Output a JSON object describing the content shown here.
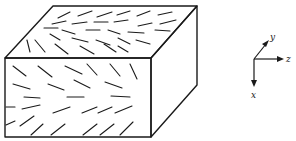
{
  "figure": {
    "box": {
      "front_face": [
        [
          5,
          58
        ],
        [
          151,
          58
        ],
        [
          151,
          137
        ],
        [
          5,
          137
        ]
      ],
      "top_face": [
        [
          5,
          58
        ],
        [
          53,
          6
        ],
        [
          197,
          6
        ],
        [
          151,
          58
        ]
      ],
      "side_face": [
        [
          151,
          58
        ],
        [
          197,
          6
        ],
        [
          197,
          85
        ],
        [
          151,
          137
        ]
      ]
    },
    "top_fibers": [
      [
        58,
        18,
        70,
        12
      ],
      [
        78,
        16,
        92,
        11
      ],
      [
        97,
        17,
        112,
        12
      ],
      [
        117,
        15,
        130,
        11
      ],
      [
        137,
        16,
        150,
        11
      ],
      [
        158,
        15,
        172,
        12
      ],
      [
        52,
        24,
        66,
        21
      ],
      [
        72,
        24,
        87,
        22
      ],
      [
        94,
        22,
        108,
        22
      ],
      [
        114,
        22,
        128,
        20
      ],
      [
        138,
        26,
        152,
        23
      ],
      [
        160,
        24,
        176,
        20
      ],
      [
        44,
        28,
        58,
        28
      ],
      [
        62,
        30,
        75,
        34
      ],
      [
        86,
        30,
        100,
        30
      ],
      [
        108,
        30,
        120,
        34
      ],
      [
        128,
        32,
        144,
        33
      ],
      [
        155,
        30,
        170,
        31
      ],
      [
        50,
        34,
        60,
        40
      ],
      [
        72,
        38,
        88,
        42
      ],
      [
        96,
        40,
        110,
        45
      ],
      [
        118,
        38,
        130,
        44
      ],
      [
        136,
        40,
        150,
        44
      ],
      [
        27,
        40,
        30,
        52
      ],
      [
        35,
        40,
        45,
        52
      ],
      [
        55,
        44,
        68,
        54
      ],
      [
        80,
        46,
        94,
        54
      ],
      [
        104,
        44,
        116,
        52
      ],
      [
        118,
        46,
        128,
        52
      ]
    ],
    "front_fibers": [
      [
        13,
        66,
        26,
        76
      ],
      [
        38,
        66,
        52,
        77
      ],
      [
        65,
        66,
        82,
        74
      ],
      [
        87,
        64,
        97,
        75
      ],
      [
        110,
        64,
        120,
        76
      ],
      [
        130,
        64,
        137,
        79
      ],
      [
        13,
        84,
        30,
        89
      ],
      [
        48,
        84,
        64,
        90
      ],
      [
        74,
        80,
        90,
        88
      ],
      [
        105,
        82,
        122,
        88
      ],
      [
        24,
        97,
        40,
        98
      ],
      [
        67,
        97,
        84,
        97
      ],
      [
        111,
        96,
        130,
        97
      ],
      [
        6,
        107,
        15,
        107
      ],
      [
        22,
        109,
        40,
        105
      ],
      [
        53,
        113,
        70,
        107
      ],
      [
        82,
        113,
        97,
        107
      ],
      [
        98,
        113,
        112,
        107
      ],
      [
        115,
        113,
        132,
        106
      ],
      [
        6,
        125,
        15,
        121
      ],
      [
        20,
        126,
        34,
        116
      ],
      [
        31,
        135,
        43,
        124
      ],
      [
        51,
        135,
        65,
        124
      ],
      [
        83,
        135,
        97,
        124
      ],
      [
        100,
        135,
        114,
        124
      ],
      [
        120,
        135,
        133,
        122
      ]
    ],
    "axes": {
      "origin": [
        254,
        59
      ],
      "labels": {
        "y": "y",
        "z": "z",
        "x": "x"
      }
    }
  }
}
